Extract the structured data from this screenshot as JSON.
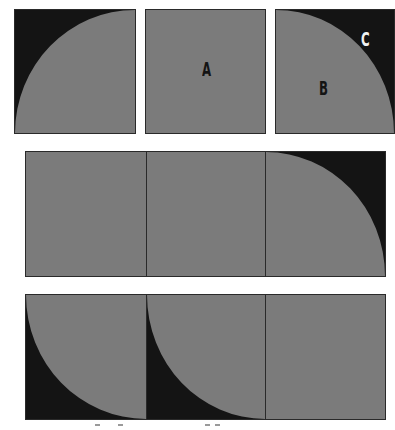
{
  "colors": {
    "gray": "#7b7b7b",
    "black": "#141414",
    "label_dark": "#141414",
    "label_light": "#f2f2f2",
    "background": "#ffffff"
  },
  "top_row": {
    "tiles": [
      {
        "id": "tile-1",
        "shape": "quarter-circle-bottom-left-gray-black-top-left",
        "label": ""
      },
      {
        "id": "tile-2",
        "shape": "solid-gray",
        "label": "A"
      },
      {
        "id": "tile-3",
        "shape": "quarter-circle-bottom-left-gray-black-top-right",
        "label": "B",
        "corner_label": "C"
      }
    ]
  },
  "middle_row": {
    "tiles": [
      {
        "id": "tile-4",
        "shape": "solid-gray"
      },
      {
        "id": "tile-5",
        "shape": "solid-gray"
      },
      {
        "id": "tile-6",
        "shape": "quarter-circle-black-top-right"
      }
    ]
  },
  "bottom_row": {
    "tiles": [
      {
        "id": "tile-7",
        "shape": "quarter-circle-black-bottom-left"
      },
      {
        "id": "tile-8",
        "shape": "quarter-circle-black-bottom-left"
      },
      {
        "id": "tile-9",
        "shape": "solid-gray"
      }
    ]
  }
}
